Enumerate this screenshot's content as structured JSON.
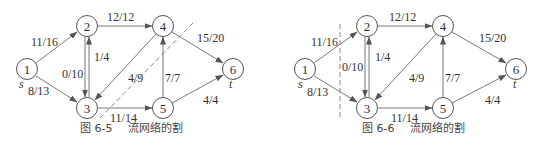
{
  "figures": [
    {
      "id": "fig-6-5",
      "caption_number": "图 6-5",
      "caption_title": "流网络的割",
      "source_label": "s",
      "sink_label": "t",
      "nodes": [
        {
          "id": "1",
          "label": "1",
          "x": 27,
          "y": 69
        },
        {
          "id": "2",
          "label": "2",
          "x": 87,
          "y": 26
        },
        {
          "id": "3",
          "label": "3",
          "x": 87,
          "y": 108
        },
        {
          "id": "4",
          "label": "4",
          "x": 163,
          "y": 26
        },
        {
          "id": "5",
          "label": "5",
          "x": 163,
          "y": 108
        },
        {
          "id": "6",
          "label": "6",
          "x": 233,
          "y": 69
        }
      ],
      "edges": [
        {
          "from": "1",
          "to": "2",
          "label": "11/16"
        },
        {
          "from": "1",
          "to": "3",
          "label": "8/13"
        },
        {
          "from": "2",
          "to": "4",
          "label": "12/12"
        },
        {
          "from": "2",
          "to": "3",
          "label": "0/10"
        },
        {
          "from": "3",
          "to": "2",
          "label": "1/4"
        },
        {
          "from": "4",
          "to": "3",
          "label": "4/9"
        },
        {
          "from": "3",
          "to": "5",
          "label": "11/14"
        },
        {
          "from": "5",
          "to": "4",
          "label": "7/7"
        },
        {
          "from": "4",
          "to": "6",
          "label": "15/20"
        },
        {
          "from": "5",
          "to": "6",
          "label": "4/4"
        }
      ],
      "cut": "diagonal dashed line between {1,2,3,4} side and {5,6}"
    },
    {
      "id": "fig-6-6",
      "caption_number": "图 6-6",
      "caption_title": "流网络的割",
      "source_label": "s",
      "sink_label": "t",
      "nodes": [
        {
          "id": "1",
          "label": "1",
          "x": 305,
          "y": 69
        },
        {
          "id": "2",
          "label": "2",
          "x": 367,
          "y": 26
        },
        {
          "id": "3",
          "label": "3",
          "x": 367,
          "y": 108
        },
        {
          "id": "4",
          "label": "4",
          "x": 443,
          "y": 26
        },
        {
          "id": "5",
          "label": "5",
          "x": 443,
          "y": 108
        },
        {
          "id": "6",
          "label": "6",
          "x": 516,
          "y": 69
        }
      ],
      "edges": [
        {
          "from": "1",
          "to": "2",
          "label": "11/16"
        },
        {
          "from": "1",
          "to": "3",
          "label": "8/13"
        },
        {
          "from": "2",
          "to": "4",
          "label": "12/12"
        },
        {
          "from": "2",
          "to": "3",
          "label": "0/10"
        },
        {
          "from": "3",
          "to": "2",
          "label": "1/4"
        },
        {
          "from": "4",
          "to": "3",
          "label": "4/9"
        },
        {
          "from": "3",
          "to": "5",
          "label": "11/14"
        },
        {
          "from": "5",
          "to": "4",
          "label": "7/7"
        },
        {
          "from": "4",
          "to": "6",
          "label": "15/20"
        },
        {
          "from": "5",
          "to": "6",
          "label": "4/4"
        }
      ],
      "cut": "vertical dashed line separating {1} from {2,3,4,5,6}"
    }
  ]
}
